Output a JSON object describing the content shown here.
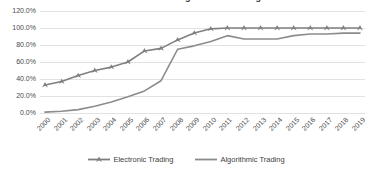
{
  "chart_data": {
    "type": "line",
    "title": "Electronic and Algorithmic Trading",
    "xlabel": "",
    "ylabel": "",
    "ylim": [
      0,
      120
    ],
    "ytick_labels": [
      "120.0%",
      "100.0%",
      "80.0%",
      "60.0%",
      "40.0%",
      "20.0%",
      "0.0%"
    ],
    "ytick_values": [
      120,
      100,
      80,
      60,
      40,
      20,
      0
    ],
    "grid": true,
    "legend_position": "bottom",
    "categories": [
      "2000",
      "2001",
      "2002",
      "2003",
      "2004",
      "2005",
      "2006",
      "2007",
      "2008",
      "2009",
      "2010",
      "2011",
      "2012",
      "2013",
      "2014",
      "2015",
      "2016",
      "2017",
      "2018",
      "2019"
    ],
    "series": [
      {
        "name": "Electronic Trading",
        "color": "#7f7f7f",
        "marker": "triangle",
        "values": [
          33,
          37,
          44,
          50,
          54,
          60,
          73,
          76,
          86,
          94,
          99,
          100,
          100,
          100,
          100,
          100,
          100,
          100,
          100,
          100
        ]
      },
      {
        "name": "Algorithmic Trading",
        "color": "#8c8c8c",
        "marker": "none",
        "values": [
          1,
          2,
          4,
          8,
          13,
          19,
          26,
          38,
          75,
          79,
          84,
          91,
          87,
          87,
          87,
          91,
          93,
          93,
          94,
          94
        ]
      }
    ]
  },
  "legend": {
    "items": [
      {
        "label": "Electronic Trading"
      },
      {
        "label": "Algorithmic Trading"
      }
    ]
  }
}
